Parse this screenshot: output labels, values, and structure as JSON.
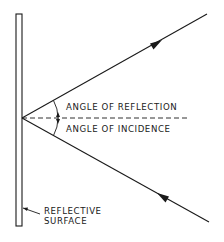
{
  "diagram": {
    "labels": {
      "angle_of_reflection": "ANGLE OF REFLECTION",
      "angle_of_incidence": "ANGLE OF INCIDENCE",
      "surface_line1": "REFLECTIVE",
      "surface_line2": "SURFACE"
    },
    "elements": {
      "surface": {
        "x": 16,
        "y": 14,
        "width": 6,
        "height": 212
      },
      "point_of_incidence": {
        "x": 22,
        "y": 118
      },
      "reflected_ray_end": {
        "x": 207,
        "y": 14
      },
      "incident_ray_start": {
        "x": 209,
        "y": 222
      },
      "normal_line_end_x": 190
    },
    "colors": {
      "stroke": "#1a1a1a",
      "background": "#ffffff"
    }
  }
}
